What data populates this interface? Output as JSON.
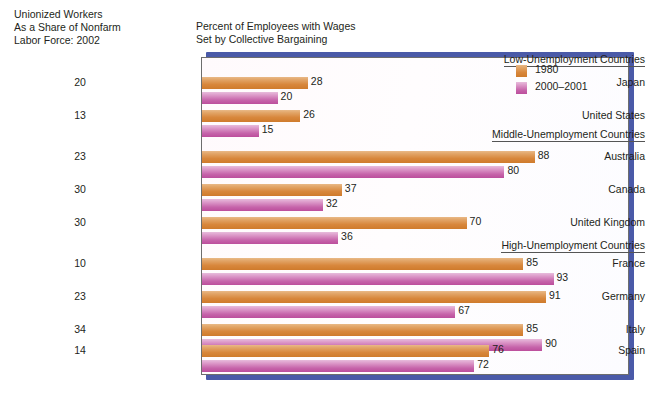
{
  "headings": {
    "left": "Unionized Workers\nAs a Share of Nonfarm\nLabor Force: 2002",
    "right": "Percent of Employees with Wages\nSet by Collective Bargaining"
  },
  "legend": {
    "items": [
      {
        "label": "1980",
        "color": "#d8873c"
      },
      {
        "label": "2000–2001",
        "color": "#c664aa"
      }
    ]
  },
  "sections": [
    {
      "title": "Low-Unemployment Countries"
    },
    {
      "title": "Middle-Unemployment Countries"
    },
    {
      "title": "High-Unemployment Countries"
    }
  ],
  "rows": [
    {
      "country": "Japan",
      "share": "20",
      "v1980": "28",
      "v2000": "20"
    },
    {
      "country": "United States",
      "share": "13",
      "v1980": "26",
      "v2000": "15"
    },
    {
      "country": "Australia",
      "share": "23",
      "v1980": "88",
      "v2000": "80"
    },
    {
      "country": "Canada",
      "share": "30",
      "v1980": "37",
      "v2000": "32"
    },
    {
      "country": "United Kingdom",
      "share": "30",
      "v1980": "70",
      "v2000": "36"
    },
    {
      "country": "France",
      "share": "10",
      "v1980": "85",
      "v2000": "93"
    },
    {
      "country": "Germany",
      "share": "23",
      "v1980": "91",
      "v2000": "67"
    },
    {
      "country": "Italy",
      "share": "34",
      "v1980": "85",
      "v2000": "90"
    },
    {
      "country": "Spain",
      "share": "14",
      "v1980": "76",
      "v2000": "72"
    }
  ],
  "chart_data": {
    "type": "bar",
    "title": "Percent of Employees with Wages Set by Collective Bargaining",
    "subtitle": "Unionized Workers As a Share of Nonfarm Labor Force: 2002",
    "orientation": "horizontal",
    "xlabel": "",
    "ylabel": "",
    "xlim": [
      0,
      100
    ],
    "grid": false,
    "legend_position": "top-right",
    "categories": [
      "Japan",
      "United States",
      "Australia",
      "Canada",
      "United Kingdom",
      "France",
      "Germany",
      "Italy",
      "Spain"
    ],
    "groups": [
      {
        "name": "Low-Unemployment Countries",
        "categories": [
          "Japan",
          "United States"
        ]
      },
      {
        "name": "Middle-Unemployment Countries",
        "categories": [
          "Australia",
          "Canada",
          "United Kingdom"
        ]
      },
      {
        "name": "High-Unemployment Countries",
        "categories": [
          "France",
          "Germany",
          "Italy",
          "Spain"
        ]
      }
    ],
    "series": [
      {
        "name": "1980",
        "color": "#d8873c",
        "values": [
          28,
          26,
          88,
          37,
          70,
          85,
          91,
          85,
          76
        ]
      },
      {
        "name": "2000–2001",
        "color": "#c664aa",
        "values": [
          20,
          15,
          80,
          32,
          36,
          93,
          67,
          90,
          72
        ]
      }
    ],
    "annotation_series": {
      "name": "Unionized Workers As a Share of Nonfarm Labor Force: 2002",
      "values": [
        20,
        13,
        23,
        30,
        30,
        10,
        23,
        34,
        14
      ]
    }
  }
}
